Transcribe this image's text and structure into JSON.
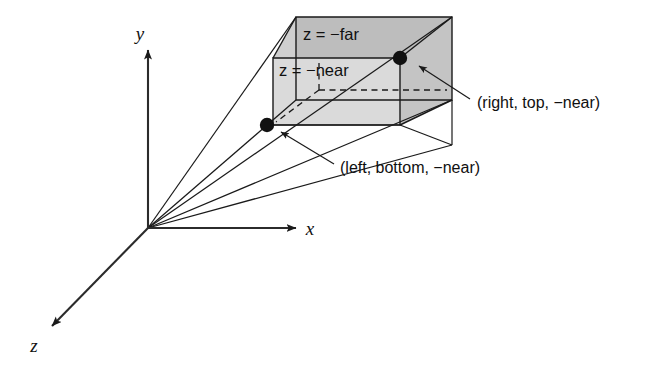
{
  "figure": {
    "background_color": "#ffffff",
    "line_color": "#1a1a1a",
    "width": 657,
    "height": 369
  },
  "axes": {
    "origin": {
      "x": 148,
      "y": 228
    },
    "x_axis": {
      "label": "x",
      "label_x": 310,
      "label_y": 235,
      "tip_x": 296,
      "tip_y": 228
    },
    "y_axis": {
      "label": "y",
      "label_x": 140,
      "label_y": 40,
      "tip_x": 148,
      "tip_y": 50
    },
    "z_axis": {
      "label": "z",
      "label_x": 30,
      "label_y": 352,
      "tip_x": 50,
      "tip_y": 328
    }
  },
  "frustum": {
    "near_plane_label": "z = −near",
    "far_plane_label": "z = −far",
    "near_fill": "#d9d9d9",
    "far_fill": "#bdbdbd",
    "side_fill": "#c6c6c6",
    "top_fill": "#cfcfcf",
    "near_label_x": 279,
    "near_label_y": 76,
    "far_label_x": 303,
    "far_label_y": 40
  },
  "callouts": [
    {
      "name": "right-top-near",
      "text": "(right, top, −near)",
      "text_x": 477,
      "text_y": 108,
      "marker_x": 400,
      "marker_y": 58,
      "leader_from_x": 470,
      "leader_from_y": 99,
      "leader_to_x": 419,
      "leader_to_y": 66
    },
    {
      "name": "left-bottom-near",
      "text": "(left, bottom, −near)",
      "text_x": 340,
      "text_y": 173,
      "marker_x": 267,
      "marker_y": 125,
      "leader_from_x": 334,
      "leader_from_y": 164,
      "leader_to_x": 281,
      "leader_to_y": 132
    }
  ],
  "geometry": {
    "near_plane": {
      "top_left": {
        "x": 273,
        "y": 58
      },
      "top_right": {
        "x": 400,
        "y": 58
      },
      "bottom_right": {
        "x": 400,
        "y": 125
      },
      "bottom_left": {
        "x": 273,
        "y": 125
      }
    },
    "far_plane": {
      "top_left": {
        "x": 296,
        "y": 17
      },
      "top_right": {
        "x": 452,
        "y": 17
      },
      "bottom_right": {
        "x": 452,
        "y": 100
      },
      "bottom_left": {
        "x": 296,
        "y": 100
      }
    },
    "hidden_corner": {
      "x": 319,
      "y": 90
    },
    "bottom_far_left": {
      "x": 296,
      "y": 100
    },
    "rays": [
      {
        "to_x": 296,
        "to_y": 17
      },
      {
        "to_x": 452,
        "to_y": 17
      },
      {
        "to_x": 296,
        "to_y": 100
      },
      {
        "to_x": 452,
        "to_y": 100
      },
      {
        "to_x": 452,
        "to_y": 145
      }
    ]
  }
}
